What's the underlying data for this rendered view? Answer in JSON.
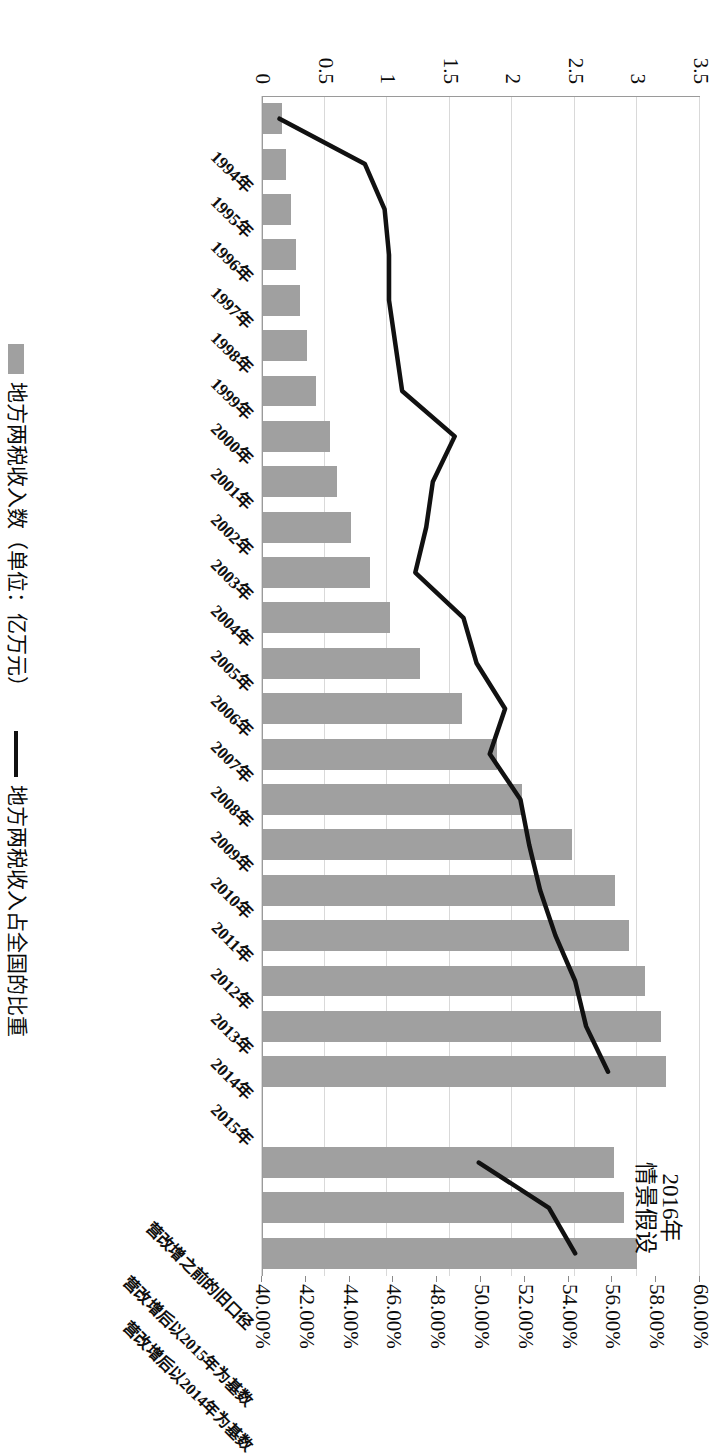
{
  "chart": {
    "annotation": {
      "line1": "2016年",
      "line2": "情景假设"
    },
    "legend": [
      {
        "key": "bars",
        "marker": "bar-swatch",
        "label": "地方两税收入数（单位：亿万元）"
      },
      {
        "key": "line",
        "marker": "line-swatch",
        "label": "地方两税收入占全国的比重"
      }
    ]
  },
  "chart_data": {
    "type": "bar",
    "title": "",
    "subtitle": "",
    "xlabel": "",
    "ylabel": "地方两税收入数（单位：亿万元）",
    "y2label": "地方两税收入占全国的比重",
    "ylim": [
      0,
      3.5
    ],
    "y2lim": [
      0.4,
      0.6
    ],
    "grid": true,
    "legend_position": "bottom",
    "categories": [
      "1994年",
      "1995年",
      "1996年",
      "1997年",
      "1998年",
      "1999年",
      "2000年",
      "2001年",
      "2002年",
      "2003年",
      "2004年",
      "2005年",
      "2006年",
      "2007年",
      "2008年",
      "2009年",
      "2010年",
      "2011年",
      "2012年",
      "2013年",
      "2014年",
      "2015年",
      "",
      "营改增之前的旧口径",
      "营改增后以2015年为基数",
      "营改增后以2014年为基数"
    ],
    "ytick_labels": [
      "0",
      "0.5",
      "1",
      "1.5",
      "2",
      "2.5",
      "3",
      "3.5"
    ],
    "ytick_values": [
      0,
      0.5,
      1,
      1.5,
      2,
      2.5,
      3,
      3.5
    ],
    "y2tick_labels": [
      "40.00%",
      "42.00%",
      "44.00%",
      "46.00%",
      "48.00%",
      "50.00%",
      "52.00%",
      "54.00%",
      "56.00%",
      "58.00%",
      "60.00%"
    ],
    "y2tick_values": [
      0.4,
      0.42,
      0.44,
      0.46,
      0.48,
      0.5,
      0.52,
      0.54,
      0.56,
      0.58,
      0.6
    ],
    "series": [
      {
        "name": "地方两税收入数（单位：亿万元）",
        "type": "bar",
        "axis": "left",
        "color": "#a0a0a0",
        "values": [
          0.16,
          0.19,
          0.23,
          0.27,
          0.3,
          0.36,
          0.43,
          0.54,
          0.6,
          0.71,
          0.86,
          1.02,
          1.26,
          1.6,
          1.88,
          2.08,
          2.48,
          2.82,
          2.93,
          3.06,
          3.19,
          3.23,
          null,
          2.81,
          2.89,
          3.0
        ]
      },
      {
        "name": "地方两税收入占全国的比重",
        "type": "line",
        "axis": "right",
        "color": "#111111",
        "values": [
          0.408,
          0.447,
          0.456,
          0.458,
          0.458,
          0.461,
          0.464,
          0.488,
          0.478,
          0.475,
          0.47,
          0.492,
          0.498,
          0.511,
          0.504,
          0.518,
          0.522,
          0.527,
          0.534,
          0.543,
          0.548,
          0.558,
          null,
          0.499,
          0.531,
          0.543
        ]
      }
    ]
  }
}
